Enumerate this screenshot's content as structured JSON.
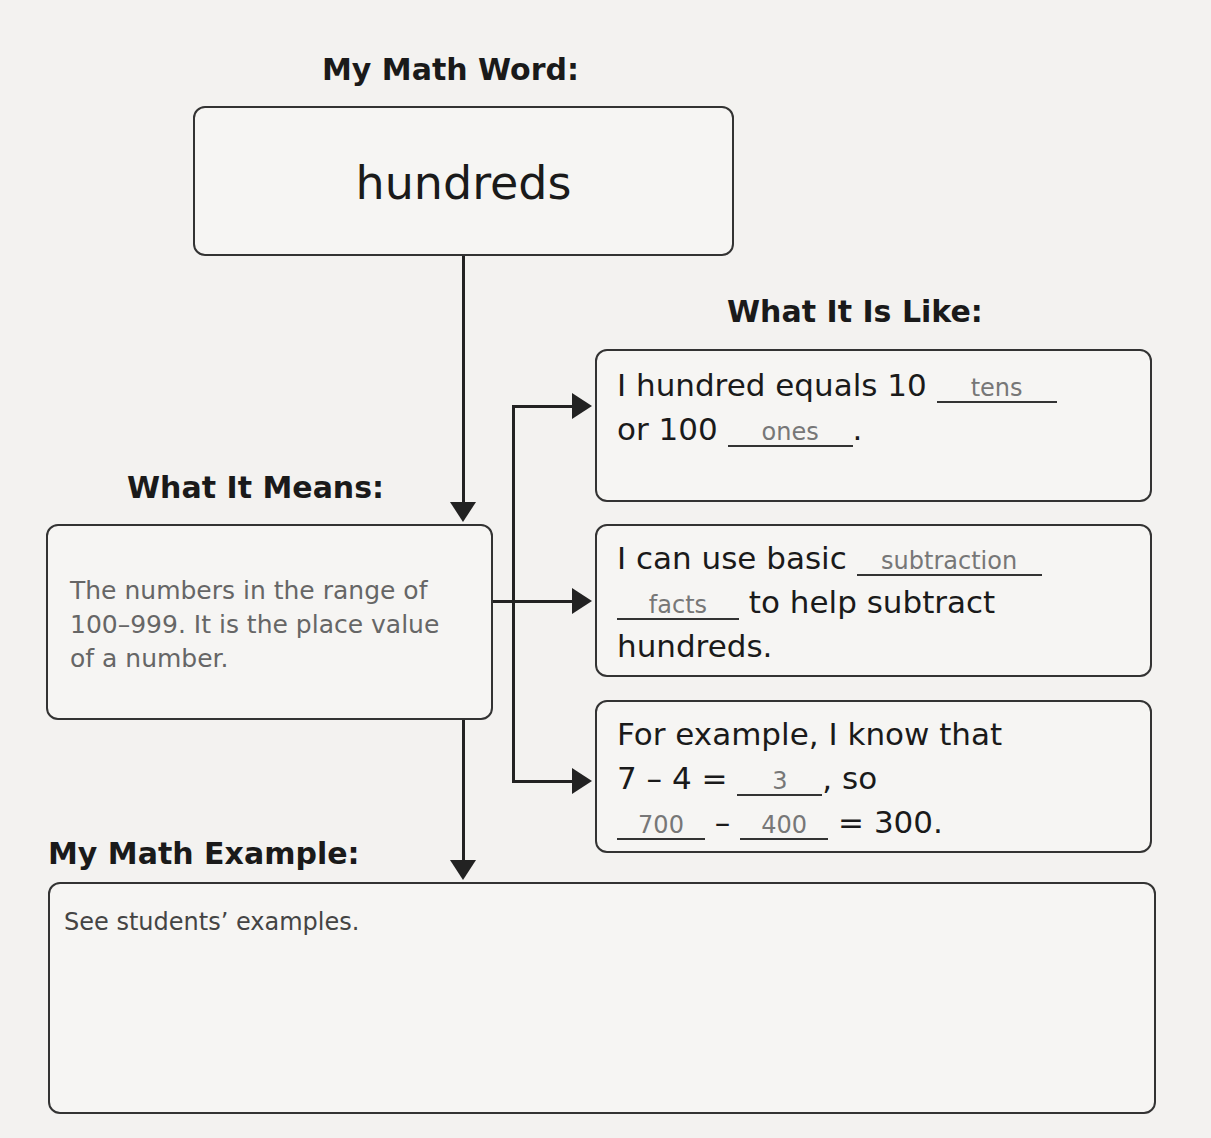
{
  "word_section": {
    "heading": "My Math Word:",
    "word": "hundreds"
  },
  "means_section": {
    "heading": "What It Means:",
    "text": "The numbers in the range of 100–999. It is the place value of a number."
  },
  "like_section": {
    "heading": "What It Is Like:",
    "box1": {
      "t1": "I hundred equals 10 ",
      "a1": "tens",
      "t2": "or 100 ",
      "a2": "ones",
      "t3": "."
    },
    "box2": {
      "t1": "I can use basic ",
      "a1": "subtraction",
      "a2": "facts",
      "t2": " to help subtract",
      "t3": "hundreds."
    },
    "box3": {
      "t1": "For example, I know that",
      "t2": "7 – 4 = ",
      "a1": "3",
      "t3": ", so",
      "a2": "700",
      "t4": " – ",
      "a3": "400",
      "t5": " = 300."
    }
  },
  "example_section": {
    "heading": "My Math Example:",
    "text": "See students’ examples."
  }
}
